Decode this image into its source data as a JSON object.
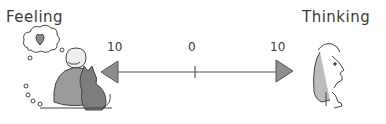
{
  "left_label": "Feeling",
  "right_label": "Thinking",
  "scale": {
    "left_value": "10",
    "center_value": "0",
    "right_value": "10"
  },
  "icons": {
    "left": "person-hugging-cat-dreaming-heart",
    "right": "person-thinking-hand-on-chin"
  },
  "colors": {
    "line": "#444444",
    "arrowhead": "#8a8a8a",
    "fill_gray": "#9a9a9a"
  }
}
